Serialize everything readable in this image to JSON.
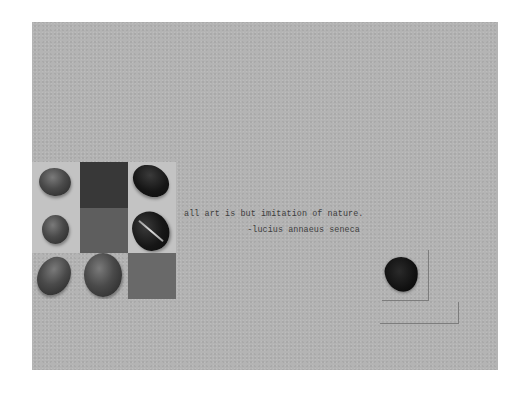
{
  "card": {
    "background": "#b4b4b4"
  },
  "quote": {
    "text": "all art is but imitation of nature.",
    "attribution": "-lucius annaeus seneca"
  },
  "grid": {
    "cells": [
      {
        "row": 1,
        "col": 1,
        "tone": "light",
        "content": "gray-pebble"
      },
      {
        "row": 1,
        "col": 2,
        "tone": "dark",
        "content": "none"
      },
      {
        "row": 1,
        "col": 3,
        "tone": "light",
        "content": "black-oval-pebble"
      },
      {
        "row": 2,
        "col": 1,
        "tone": "light",
        "content": "gray-pebble"
      },
      {
        "row": 2,
        "col": 2,
        "tone": "mid",
        "content": "none"
      },
      {
        "row": 2,
        "col": 3,
        "tone": "light",
        "content": "coffee-bean"
      },
      {
        "row": 3,
        "col": 1,
        "tone": "blank",
        "content": "oval-pebble"
      },
      {
        "row": 3,
        "col": 2,
        "tone": "blank",
        "content": "large-round-pebble"
      },
      {
        "row": 3,
        "col": 3,
        "tone": "mid",
        "content": "none"
      }
    ],
    "colors": {
      "light": "#c3c3c3",
      "dark": "#383838",
      "mid": "#5e5e5e",
      "mid2": "#696969"
    }
  },
  "accent": {
    "frame_line": "#7d7d7d",
    "text": "#3d3d3d"
  }
}
